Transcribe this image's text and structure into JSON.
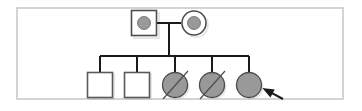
{
  "figure": {
    "kind": "pedigree-chart",
    "title": "",
    "frame": {
      "border_color": "#d4d4d4",
      "background": "#ffffff"
    },
    "style": {
      "line_color": "#1a1a1a",
      "symbol_stroke": "#4d4d4d",
      "affected_fill": "#999999",
      "unaffected_fill": "#ffffff",
      "shadow_color": "#b3b3b3"
    },
    "legend_semantics": {
      "square": "male",
      "circle": "female",
      "gray_fill": "affected",
      "dot_in_symbol": "carrier",
      "diagonal_slash": "deceased",
      "arrow": "proband"
    }
  },
  "chart_data": {
    "type": "diagram",
    "generations": [
      {
        "id": "I",
        "label": "",
        "members": [
          {
            "id": "I-1",
            "shape": "square",
            "sex": "male",
            "fill": "#ffffff",
            "carrier_dot": true,
            "dot_fill": "#999999",
            "deceased": false,
            "proband": false,
            "cx": 144,
            "cy": 23,
            "size": 25
          },
          {
            "id": "I-2",
            "shape": "circle",
            "sex": "female",
            "fill": "#ffffff",
            "carrier_dot": true,
            "dot_fill": "#999999",
            "deceased": false,
            "proband": false,
            "cx": 194,
            "cy": 23,
            "size": 24
          }
        ],
        "mating_line": {
          "x1": 157,
          "x2": 181,
          "y": 23
        }
      },
      {
        "id": "II",
        "label": "",
        "members": [
          {
            "id": "II-1",
            "shape": "square",
            "sex": "male",
            "fill": "#ffffff",
            "carrier_dot": false,
            "dot_fill": "",
            "deceased": false,
            "proband": false,
            "cx": 100,
            "cy": 85,
            "size": 25
          },
          {
            "id": "II-2",
            "shape": "square",
            "sex": "male",
            "fill": "#ffffff",
            "carrier_dot": false,
            "dot_fill": "",
            "deceased": false,
            "proband": false,
            "cx": 137,
            "cy": 85,
            "size": 25
          },
          {
            "id": "II-3",
            "shape": "circle",
            "sex": "female",
            "fill": "#999999",
            "carrier_dot": false,
            "dot_fill": "",
            "deceased": true,
            "proband": false,
            "cx": 175,
            "cy": 85,
            "size": 25
          },
          {
            "id": "II-4",
            "shape": "circle",
            "sex": "female",
            "fill": "#999999",
            "carrier_dot": false,
            "dot_fill": "",
            "deceased": true,
            "proband": false,
            "cx": 212,
            "cy": 85,
            "size": 25
          },
          {
            "id": "II-5",
            "shape": "circle",
            "sex": "female",
            "fill": "#999999",
            "carrier_dot": false,
            "dot_fill": "",
            "deceased": false,
            "proband": true,
            "cx": 249,
            "cy": 85,
            "size": 25
          }
        ],
        "sibship_line": {
          "x1": 100,
          "x2": 249,
          "y": 56
        },
        "descent_line": {
          "x": 169,
          "y1": 23,
          "y2": 56
        }
      }
    ],
    "proband_arrow": {
      "target": "II-5",
      "from": {
        "x": 283,
        "y": 99
      },
      "to": {
        "x": 264,
        "y": 89
      }
    },
    "counts": {
      "generations": 2,
      "total_individuals": 7,
      "affected": 3,
      "carriers": 2,
      "unaffected": 2,
      "deceased": 2
    }
  }
}
